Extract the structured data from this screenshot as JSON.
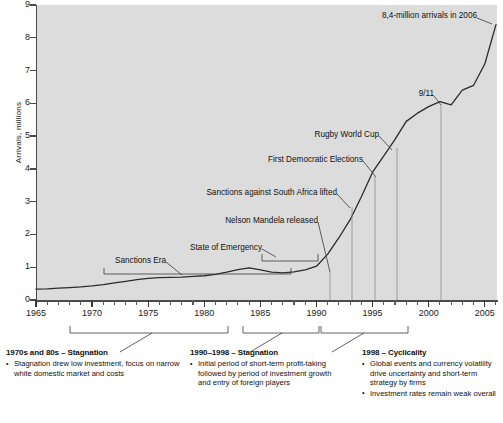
{
  "chart_data": {
    "type": "line",
    "title": "",
    "xlabel": "",
    "ylabel": "Arrivals, millions",
    "xlim": [
      1965,
      2006
    ],
    "ylim": [
      0,
      9
    ],
    "grid": false,
    "legend": "none",
    "x": [
      1965,
      1966,
      1967,
      1968,
      1969,
      1970,
      1971,
      1972,
      1973,
      1974,
      1975,
      1976,
      1977,
      1978,
      1979,
      1980,
      1981,
      1982,
      1983,
      1984,
      1985,
      1986,
      1987,
      1988,
      1989,
      1990,
      1991,
      1992,
      1993,
      1994,
      1995,
      1996,
      1997,
      1998,
      1999,
      2000,
      2001,
      2002,
      2003,
      2004,
      2005,
      2006
    ],
    "values": [
      0.33,
      0.34,
      0.36,
      0.38,
      0.4,
      0.43,
      0.47,
      0.52,
      0.57,
      0.62,
      0.66,
      0.68,
      0.69,
      0.7,
      0.72,
      0.74,
      0.78,
      0.85,
      0.93,
      0.98,
      0.92,
      0.85,
      0.83,
      0.86,
      0.92,
      1.03,
      1.4,
      1.9,
      2.45,
      3.15,
      3.9,
      4.4,
      4.9,
      5.45,
      5.7,
      5.9,
      6.05,
      5.95,
      6.4,
      6.55,
      7.2,
      8.4
    ],
    "y_ticks": [
      0,
      1,
      2,
      3,
      4,
      5,
      6,
      7,
      8,
      9
    ],
    "x_ticks_major": [
      1965,
      1970,
      1975,
      1980,
      1985,
      1990,
      1995,
      2000,
      2005
    ],
    "x_tick_start": 1965,
    "x_tick_end": 2006,
    "annotations": [
      {
        "name": "sanctions-era",
        "label": "Sanctions Era",
        "year": 1977,
        "value": 0.69
      },
      {
        "name": "state-of-emergency",
        "label": "State of Emergency",
        "year": 1986,
        "value": 0.85
      },
      {
        "name": "nelson-mandela-released",
        "label": "Nelson Mandela released",
        "year": 1990,
        "value": 1.03
      },
      {
        "name": "sanctions-lifted",
        "label": "Sanctions against South Africa lifted",
        "year": 1993,
        "value": 2.45
      },
      {
        "name": "first-democratic-elections",
        "label": "First Democratic Elections",
        "year": 1994,
        "value": 3.15
      },
      {
        "name": "rugby-world-cup",
        "label": "Rugby World Cup",
        "year": 1995,
        "value": 3.9
      },
      {
        "name": "nine-eleven",
        "label": "9/11",
        "year": 2001,
        "value": 6.05
      },
      {
        "name": "final-arrivals",
        "label": "8,4-million arrivals in 2006",
        "year": 2006,
        "value": 8.4
      }
    ],
    "period_brackets": [
      {
        "name": "bracket-1970s-80s",
        "from": 1970,
        "to": 1988
      },
      {
        "name": "bracket-1990-1998",
        "from": 1990,
        "to": 1998
      },
      {
        "name": "bracket-1998-2005",
        "from": 1998,
        "to": 2005
      }
    ]
  },
  "axis": {
    "y_title": "Arrivals, millions",
    "y_labels": [
      "9",
      "8",
      "7",
      "6",
      "5",
      "4",
      "3",
      "2",
      "1",
      "0"
    ],
    "x_labels": [
      "1965",
      "1970",
      "1975",
      "1980",
      "1985",
      "1990",
      "1995",
      "2000",
      "2005"
    ]
  },
  "annotations": {
    "final_arrivals": "8,4-million arrivals in 2006",
    "nine_eleven": "9/11",
    "rugby_world_cup": "Rugby World Cup",
    "first_democratic_elections": "First Democratic Elections",
    "sanctions_lifted": "Sanctions against South Africa lifted",
    "nelson_mandela_released": "Nelson Mandela released",
    "state_of_emergency": "State of Emergency",
    "sanctions_era": "Sanctions Era"
  },
  "notes": [
    {
      "title": "1970s and 80s – Stagnation",
      "bullets": [
        "Stagnation drew low investment, focus on narrow white domestic market and costs"
      ]
    },
    {
      "title": "1990–1998 – Stagnation",
      "bullets": [
        "Initial period of short-term profit-taking followed by period of investment growth and entry of foreign players"
      ]
    },
    {
      "title": "1998 – Cyclicality",
      "bullets": [
        "Global events and currency volatility drive uncertainty and short-term strategy by firms",
        "Investment rates remain weak overall"
      ]
    }
  ],
  "colors": {
    "plot_background": "#dcdcdc",
    "line": "#2b2b2b",
    "axis": "#4a4a4a",
    "text": "#1a1a1a"
  }
}
